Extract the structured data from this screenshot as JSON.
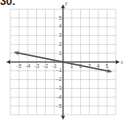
{
  "problem": {
    "number_label": "30."
  },
  "chart_data": {
    "type": "line",
    "title": "",
    "xlabel": "x",
    "ylabel": "y",
    "xlim": [
      -6,
      6
    ],
    "ylim": [
      -6,
      6
    ],
    "grid": true,
    "x_ticks": [
      -5,
      -4,
      -3,
      -2,
      -1,
      1,
      2,
      3,
      4,
      5
    ],
    "y_ticks": [
      5,
      4,
      3,
      2,
      1,
      -1,
      -2,
      -3,
      -4,
      -5
    ],
    "series": [
      {
        "name": "line",
        "x": [
          -5.5,
          5.5
        ],
        "y": [
          1.1,
          -1.1
        ],
        "slope": -0.2,
        "intercept": 0
      }
    ],
    "colors": {
      "grid": "#c8c8c8",
      "axis": "#333333",
      "line": "#555555"
    }
  }
}
